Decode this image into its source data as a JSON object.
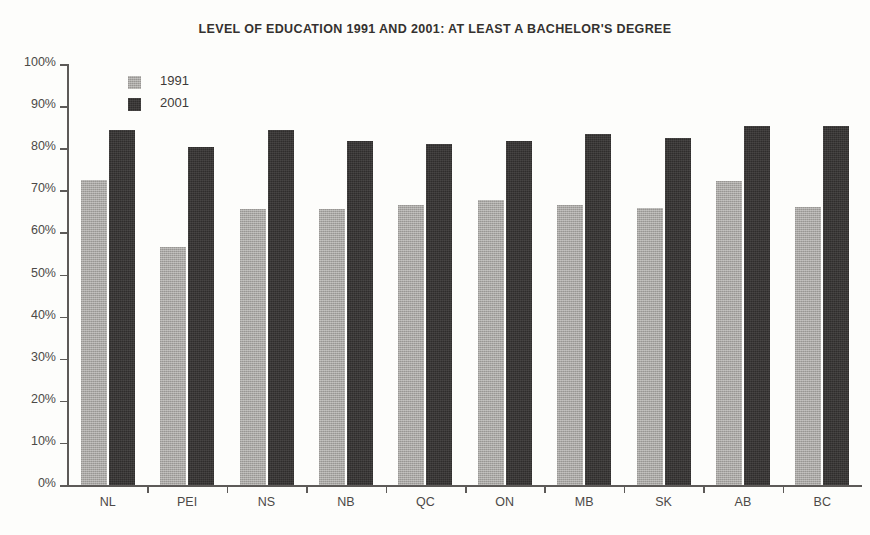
{
  "chart_data": {
    "type": "bar",
    "title": "LEVEL OF EDUCATION 1991 AND 2001: AT LEAST A BACHELOR'S DEGREE",
    "xlabel": "",
    "ylabel": "",
    "ylim": [
      0,
      100
    ],
    "yticks": [
      0,
      10,
      20,
      30,
      40,
      50,
      60,
      70,
      80,
      90,
      100
    ],
    "ytick_labels": [
      "0%",
      "10%",
      "20%",
      "30%",
      "40%",
      "50%",
      "60%",
      "70%",
      "80%",
      "90%",
      "100%"
    ],
    "grid": false,
    "legend_position": "upper left inside",
    "categories": [
      "NL",
      "PEI",
      "NS",
      "NB",
      "QC",
      "ON",
      "MB",
      "SK",
      "AB",
      "BC"
    ],
    "series": [
      {
        "name": "1991",
        "color": "#a9a7a4",
        "values": [
          72.4,
          56.5,
          65.6,
          65.6,
          66.5,
          67.7,
          66.5,
          65.8,
          72.2,
          66.0
        ]
      },
      {
        "name": "2001",
        "color": "#2f2d2c",
        "values": [
          84.3,
          80.3,
          84.3,
          81.7,
          81.0,
          81.7,
          83.4,
          82.4,
          85.3,
          85.3
        ]
      }
    ]
  }
}
